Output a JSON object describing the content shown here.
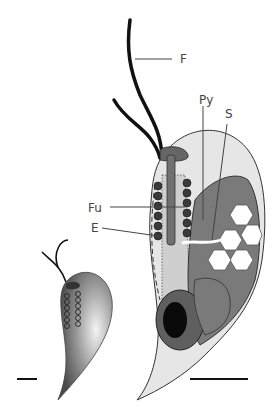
{
  "diagram": {
    "type": "cell-anatomy-illustration",
    "labels": [
      {
        "id": "F",
        "text": "F"
      },
      {
        "id": "Py",
        "text": "Py"
      },
      {
        "id": "S",
        "text": "S"
      },
      {
        "id": "Fu",
        "text": "Fu"
      },
      {
        "id": "E",
        "text": "E"
      }
    ],
    "scale_bars": 2,
    "colors": {
      "flagella": "#111111",
      "cell_outline": "#333333",
      "cell_fill": "#e6e6e6",
      "chloroplast": "#7a7a7a",
      "nucleus": "#5f5f5f",
      "nucleolus": "#0a0a0a",
      "ejectisomes": "#3a3a3a",
      "small_cell": "#6e6e6e"
    }
  }
}
